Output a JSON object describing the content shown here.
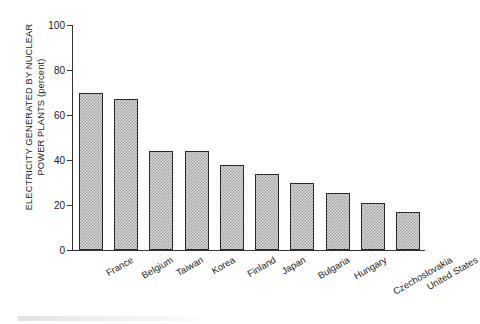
{
  "chart_data": {
    "type": "bar",
    "title": "",
    "xlabel": "",
    "ylabel": "ELECTRICITY GENERATED BY NUCLEAR POWER PLANTS (percent)",
    "ylabel_line1": "ELECTRICITY GENERATED BY NUCLEAR",
    "ylabel_line2": "POWER PLANTS (percent)",
    "ylim": [
      0,
      100
    ],
    "yticks": [
      0,
      20,
      40,
      60,
      80,
      100
    ],
    "ytick_labels": [
      "0",
      "20",
      "40",
      "60",
      "80",
      "100"
    ],
    "grid": false,
    "legend": false,
    "categories": [
      "France",
      "Belgium",
      "Taiwan",
      "Korea",
      "Finland",
      "Japan",
      "Bulgaria",
      "Hungary",
      "Czechoslovakia",
      "United States"
    ],
    "values": [
      70,
      67,
      44,
      44,
      38,
      34,
      30,
      25.5,
      21,
      17
    ],
    "bar_color": "#d8d8d8",
    "bar_edge_color": "#2a2a2a",
    "bar_fill_pattern": "checkerboard-dither"
  }
}
